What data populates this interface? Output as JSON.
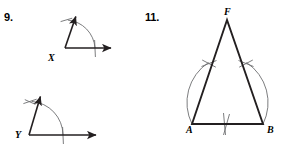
{
  "page": {
    "background_color": "#ffffff",
    "ink_color": "#231f20",
    "arc_color": "#6d6e71",
    "width": 282,
    "height": 150
  },
  "problems": [
    {
      "number_label": "9.",
      "kind": "angle-constructions",
      "figures": [
        {
          "id": "angle-x",
          "vertex_label": "X",
          "description": "angle with vertex X, one ray up-right with arrowhead, one horizontal ray right with arrowhead, compass arc crossing both rays",
          "vertex": {
            "x": 65,
            "y": 48
          },
          "rays": [
            {
              "name": "upper-ray",
              "angle_deg": 76,
              "length": 42,
              "arrowhead": true
            },
            {
              "name": "horizontal-ray",
              "angle_deg": 0,
              "length": 71,
              "arrowhead": true
            }
          ],
          "arc": {
            "radius": 30,
            "start_deg": 0,
            "end_deg": 86,
            "tick_marks": 1
          }
        },
        {
          "id": "angle-y",
          "vertex_label": "Y",
          "description": "angle with vertex Y, one ray up-right with arrowhead, one horizontal ray right with arrowhead, compass arc crossing both rays with an extra intersection tick",
          "vertex": {
            "x": 29,
            "y": 135
          },
          "rays": [
            {
              "name": "upper-ray",
              "angle_deg": 76,
              "length": 45,
              "arrowhead": true
            },
            {
              "name": "horizontal-ray",
              "angle_deg": 0,
              "length": 90,
              "arrowhead": true
            }
          ],
          "arc": {
            "radius": 34,
            "start_deg": 0,
            "end_deg": 88,
            "tick_marks": 2
          }
        }
      ]
    },
    {
      "number_label": "11.",
      "kind": "triangle-construction",
      "figure": {
        "id": "triangle-fab",
        "description": "isosceles triangle with apex F at top and base A-B, construction arcs drawn from A and B crossing the legs and meeting below the base midpoint",
        "vertices": [
          {
            "label": "F",
            "x": 227,
            "y": 20
          },
          {
            "label": "A",
            "x": 192,
            "y": 124
          },
          {
            "label": "B",
            "x": 263,
            "y": 124
          }
        ],
        "sides": [
          "FA",
          "AB",
          "BF"
        ],
        "arcs": [
          {
            "name": "arc-from-A",
            "center": "A",
            "crosses": [
              "FA",
              "below-AB-midpoint"
            ]
          },
          {
            "name": "arc-from-B",
            "center": "B",
            "crosses": [
              "BF",
              "below-AB-midpoint"
            ]
          }
        ],
        "arc_intersection_ticks": 3
      }
    }
  ]
}
